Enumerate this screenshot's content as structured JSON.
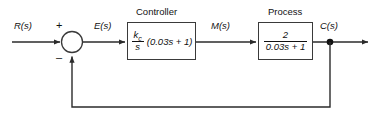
{
  "diagram": {
    "type": "control-system-block-diagram",
    "signals": {
      "input": "R(s)",
      "error": "E(s)",
      "manipulated": "M(s)",
      "output": "C(s)"
    },
    "summing_junction": {
      "plus_sign": "+",
      "minus_sign": "–"
    },
    "blocks": [
      {
        "title": "Controller",
        "numerator": "k",
        "numerator_subscript": "c",
        "denominator": "s",
        "trailing": "(0.03s + 1)"
      },
      {
        "title": "Process",
        "numerator": "2",
        "denominator": "0.03s + 1"
      }
    ],
    "colors": {
      "line": "#3a3a3a",
      "text": "#111111",
      "background": "#ffffff"
    }
  }
}
